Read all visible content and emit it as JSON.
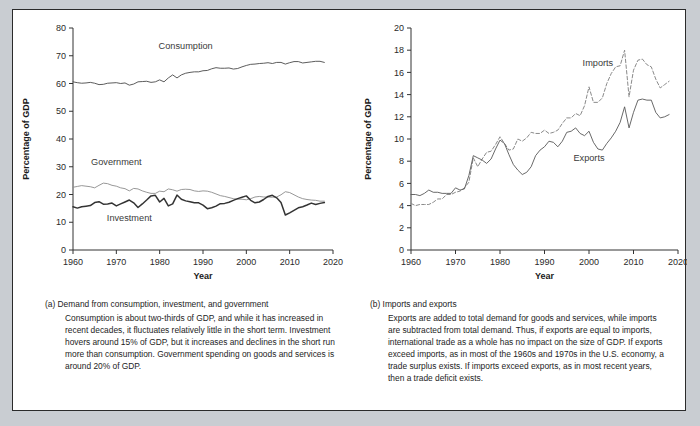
{
  "figure": {
    "background_color": "#c9cdd2",
    "frame_color": "#ffffff",
    "border_color": "#2b2b2b"
  },
  "panel_a": {
    "caption_head": "(a) Demand from consumption, investment, and government",
    "caption_body": "Consumption is about two-thirds of GDP, and while it has increased in recent decades, it fluctuates relatively little in the short term. Investment hovers around 15% of GDP, but it increases and declines in the short run more than consumption. Government spending on goods and services is around 20% of GDP."
  },
  "panel_b": {
    "caption_head": "(b) Imports and exports",
    "caption_body": "Exports are added to total demand for goods and services, while imports are subtracted from total demand. Thus, if exports are equal to imports, international trade as a whole has no impact on the size of GDP. If exports exceed imports, as in most of the 1960s and 1970s in the U.S. economy, a trade surplus exists. If imports exceed exports, as in most recent years, then a trade deficit exists."
  },
  "chart_data": [
    {
      "id": "chart-a",
      "type": "line",
      "title": "",
      "xlabel": "Year",
      "ylabel": "Percentage of GDP",
      "xlim": [
        1960,
        2020
      ],
      "ylim": [
        0,
        80
      ],
      "xticks": [
        1960,
        1970,
        1980,
        1990,
        2000,
        2010,
        2020
      ],
      "yticks": [
        0,
        10,
        20,
        30,
        40,
        50,
        60,
        70,
        80
      ],
      "grid": false,
      "legend_position": "inline-annotations",
      "x": [
        1960,
        1961,
        1962,
        1963,
        1964,
        1965,
        1966,
        1967,
        1968,
        1969,
        1970,
        1971,
        1972,
        1973,
        1974,
        1975,
        1976,
        1977,
        1978,
        1979,
        1980,
        1981,
        1982,
        1983,
        1984,
        1985,
        1986,
        1987,
        1988,
        1989,
        1990,
        1991,
        1992,
        1993,
        1994,
        1995,
        1996,
        1997,
        1998,
        1999,
        2000,
        2001,
        2002,
        2003,
        2004,
        2005,
        2006,
        2007,
        2008,
        2009,
        2010,
        2011,
        2012,
        2013,
        2014,
        2015,
        2016,
        2017,
        2018
      ],
      "series": [
        {
          "name": "Consumption",
          "style": "thin-solid",
          "color": "#4a4a4a",
          "label_x": 1986,
          "label_y": 72.5,
          "values": [
            60.6,
            60.3,
            60.1,
            60.2,
            60.4,
            60.1,
            59.6,
            59.7,
            60.1,
            60.2,
            60.3,
            60.0,
            60.2,
            59.4,
            59.8,
            60.6,
            60.7,
            60.8,
            60.4,
            60.6,
            61.3,
            60.6,
            62.0,
            63.1,
            62.0,
            63.1,
            63.7,
            64.0,
            64.2,
            64.2,
            64.6,
            64.7,
            65.3,
            65.7,
            65.5,
            65.5,
            65.6,
            65.2,
            65.4,
            66.0,
            66.5,
            66.9,
            67.0,
            67.2,
            67.3,
            67.5,
            67.2,
            67.6,
            67.6,
            67.0,
            67.5,
            67.9,
            67.9,
            67.4,
            67.6,
            67.8,
            68.0,
            68.0,
            67.6
          ]
        },
        {
          "name": "Government",
          "style": "thin-solid-light",
          "color": "#8c8c8c",
          "label_x": 1970,
          "label_y": 30.5,
          "values": [
            22.6,
            22.9,
            23.2,
            23.0,
            22.8,
            22.4,
            23.3,
            24.1,
            23.9,
            23.3,
            23.0,
            22.4,
            22.1,
            21.3,
            22.2,
            22.0,
            21.3,
            20.8,
            20.4,
            20.4,
            21.2,
            21.0,
            22.0,
            21.7,
            21.2,
            21.8,
            21.9,
            21.8,
            21.3,
            21.1,
            21.3,
            21.2,
            20.8,
            20.2,
            19.6,
            19.3,
            18.9,
            18.5,
            18.3,
            18.3,
            18.1,
            18.5,
            19.1,
            19.3,
            19.1,
            19.1,
            19.0,
            19.1,
            19.9,
            21.0,
            20.7,
            19.9,
            19.1,
            18.5,
            18.2,
            18.0,
            17.9,
            17.6,
            17.6
          ]
        },
        {
          "name": "Investment",
          "style": "bold-solid",
          "color": "#333333",
          "label_x": 1973,
          "label_y": 10.5,
          "values": [
            15.6,
            15.1,
            15.6,
            15.8,
            16.0,
            17.1,
            17.4,
            16.5,
            16.6,
            16.9,
            15.9,
            16.6,
            17.3,
            18.0,
            17.0,
            15.3,
            16.6,
            18.0,
            19.5,
            19.7,
            17.3,
            18.6,
            15.9,
            16.6,
            19.8,
            18.3,
            17.7,
            17.4,
            17.0,
            17.0,
            16.2,
            14.9,
            15.2,
            15.8,
            16.7,
            16.8,
            17.2,
            17.9,
            18.5,
            19.0,
            19.5,
            17.9,
            17.0,
            17.3,
            18.2,
            19.3,
            19.7,
            18.8,
            17.1,
            12.6,
            13.4,
            14.3,
            15.2,
            15.6,
            16.2,
            16.9,
            16.4,
            16.8,
            17.1
          ]
        }
      ]
    },
    {
      "id": "chart-b",
      "type": "line",
      "title": "",
      "xlabel": "Year",
      "ylabel": "Percentage of GDP",
      "xlim": [
        1960,
        2020
      ],
      "ylim": [
        0,
        20
      ],
      "xticks": [
        1960,
        1970,
        1980,
        1990,
        2000,
        2010,
        2020
      ],
      "yticks": [
        0,
        2,
        4,
        6,
        8,
        10,
        12,
        14,
        16,
        18,
        20
      ],
      "grid": false,
      "legend_position": "inline-annotations",
      "x": [
        1960,
        1961,
        1962,
        1963,
        1964,
        1965,
        1966,
        1967,
        1968,
        1969,
        1970,
        1971,
        1972,
        1973,
        1974,
        1975,
        1976,
        1977,
        1978,
        1979,
        1980,
        1981,
        1982,
        1983,
        1984,
        1985,
        1986,
        1987,
        1988,
        1989,
        1990,
        1991,
        1992,
        1993,
        1994,
        1995,
        1996,
        1997,
        1998,
        1999,
        2000,
        2001,
        2002,
        2003,
        2004,
        2005,
        2006,
        2007,
        2008,
        2009,
        2010,
        2011,
        2012,
        2013,
        2014,
        2015,
        2016,
        2017,
        2018
      ],
      "series": [
        {
          "name": "Imports",
          "style": "dashed",
          "color": "#8a8a8a",
          "label_x": 2002,
          "label_y": 16.6,
          "values": [
            4.2,
            4.0,
            4.1,
            4.1,
            4.1,
            4.3,
            4.6,
            4.6,
            5.0,
            5.0,
            5.2,
            5.3,
            5.6,
            6.1,
            8.3,
            7.5,
            8.2,
            8.8,
            8.9,
            9.5,
            10.2,
            9.6,
            9.0,
            9.1,
            10.0,
            9.8,
            10.1,
            10.6,
            10.5,
            10.5,
            10.8,
            10.5,
            10.6,
            10.8,
            11.4,
            11.9,
            11.9,
            12.3,
            12.1,
            13.0,
            14.7,
            13.3,
            13.3,
            13.7,
            15.0,
            15.9,
            16.5,
            16.6,
            18.0,
            13.8,
            16.2,
            17.1,
            17.2,
            16.7,
            16.5,
            15.4,
            14.6,
            14.9,
            15.2
          ]
        },
        {
          "name": "Exports",
          "style": "thin-solid",
          "color": "#585858",
          "label_x": 2000,
          "label_y": 8.0,
          "values": [
            5.0,
            5.0,
            4.9,
            5.1,
            5.4,
            5.2,
            5.2,
            5.1,
            5.1,
            5.1,
            5.6,
            5.4,
            5.5,
            6.7,
            8.5,
            8.3,
            8.1,
            7.8,
            8.2,
            9.1,
            9.9,
            9.6,
            8.6,
            7.7,
            7.2,
            6.8,
            7.0,
            7.5,
            8.5,
            9.0,
            9.3,
            9.8,
            9.7,
            9.3,
            9.8,
            10.6,
            10.7,
            11.0,
            10.5,
            10.3,
            10.7,
            9.7,
            9.1,
            9.0,
            9.6,
            10.1,
            10.7,
            11.5,
            12.9,
            11.0,
            12.4,
            13.5,
            13.6,
            13.5,
            13.5,
            12.4,
            11.9,
            12.0,
            12.2
          ]
        }
      ]
    }
  ]
}
